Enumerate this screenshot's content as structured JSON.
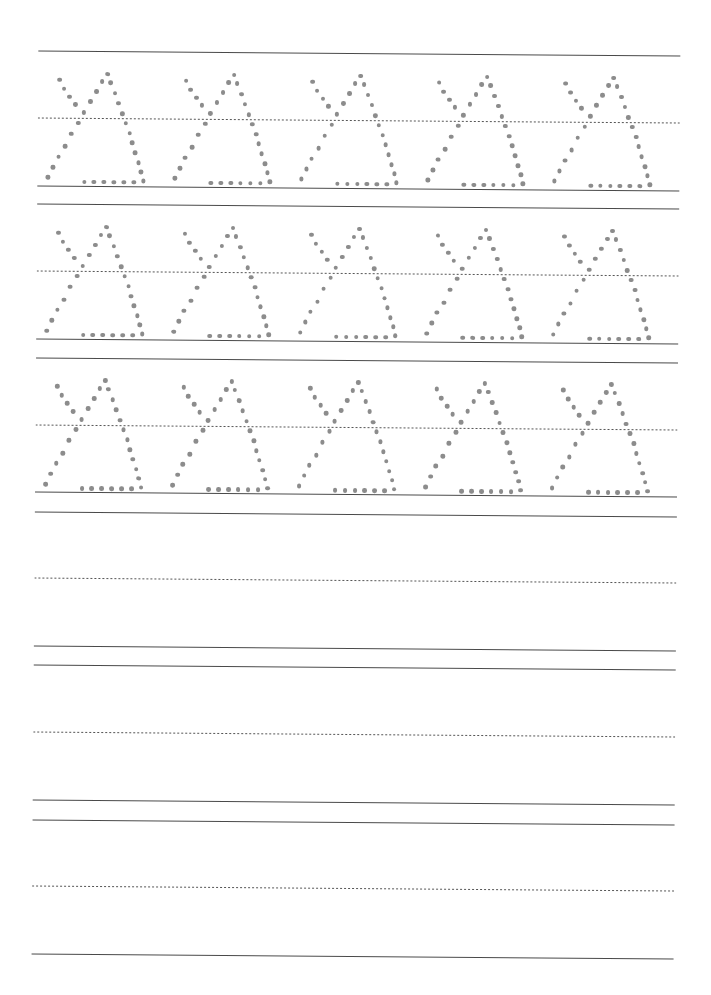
{
  "worksheet": {
    "title": "Letter A tracing practice",
    "letter": "A",
    "colors": {
      "paper": "#ffffff",
      "rule_line": "#4a4a4a",
      "midline": "#555555",
      "trace_dot": "#8c8c8c"
    },
    "line_x_start": 35,
    "line_x_end": 677,
    "rows": [
      {
        "type": "tracing",
        "top": 53.4,
        "mid": 120.3,
        "base": 188.3,
        "glyph_count": 5
      },
      {
        "type": "tracing",
        "top": 207.0,
        "mid": 274.0,
        "base": 341.5,
        "glyph_count": 5
      },
      {
        "type": "tracing",
        "top": 360.8,
        "mid": 427.5,
        "base": 495.0,
        "glyph_count": 5
      },
      {
        "type": "blank",
        "top": 514.3,
        "mid": 581.0,
        "base": 648.5
      },
      {
        "type": "blank",
        "top": 668.0,
        "mid": 734.8,
        "base": 802.5
      },
      {
        "type": "blank",
        "top": 822.5,
        "mid": 889.0,
        "base": 956.8
      }
    ],
    "glyph_layout": {
      "first_apex_x": 104.3,
      "spacing_x": 126.6,
      "apex_above_base": 112.3
    },
    "glyph_dots": [
      [
        -48,
        6
      ],
      [
        -43.4,
        15
      ],
      [
        -37.7,
        23
      ],
      [
        -32,
        30.7
      ],
      [
        -23.4,
        38.7
      ],
      [
        -28.7,
        49
      ],
      [
        -35.7,
        60
      ],
      [
        -41.7,
        72.7
      ],
      [
        -48.4,
        83
      ],
      [
        -53.7,
        93.3
      ],
      [
        -58.7,
        103.7
      ],
      [
        -17,
        27.7
      ],
      [
        -11,
        17.7
      ],
      [
        -5.4,
        7.7
      ],
      [
        0,
        0
      ],
      [
        3.3,
        8.3
      ],
      [
        7.6,
        19
      ],
      [
        11.3,
        29
      ],
      [
        15,
        39.3
      ],
      [
        18.6,
        49
      ],
      [
        22.6,
        59
      ],
      [
        25.3,
        68.7
      ],
      [
        28.3,
        78.3
      ],
      [
        31.6,
        88.3
      ],
      [
        34.3,
        97.3
      ],
      [
        36.6,
        106.3
      ],
      [
        -22.4,
        108
      ],
      [
        -12.7,
        108
      ],
      [
        -2.7,
        108
      ],
      [
        7,
        108
      ],
      [
        17,
        108
      ],
      [
        27,
        108
      ]
    ]
  }
}
